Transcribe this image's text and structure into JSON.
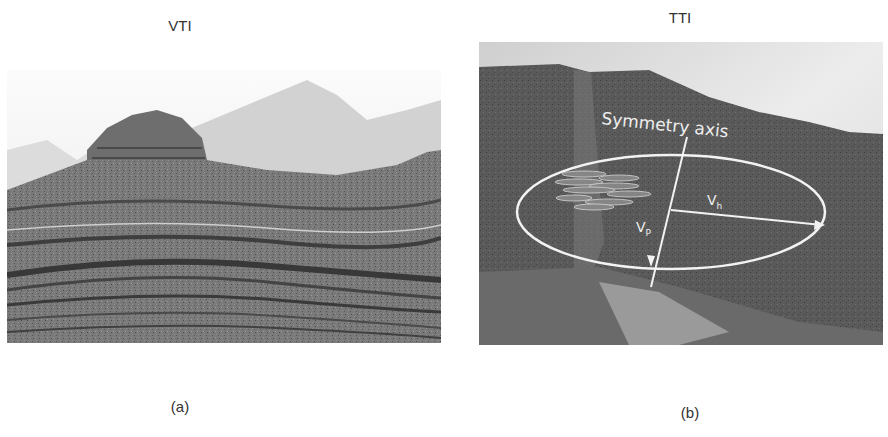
{
  "figure": {
    "panel_a": {
      "title": "VTI",
      "caption": "(a)",
      "image_description": "Horizontally layered sedimentary rock formation (canyon cliffs) illustrating vertical transverse isotropy"
    },
    "panel_b": {
      "title": "TTI",
      "caption": "(b)",
      "image_description": "Tilted rock layers on a cliff face with annotated anisotropy ellipse",
      "annotations": {
        "axis_label": "Symmetry axis",
        "vh_label": "V",
        "vh_sub": "h",
        "vp_label": "V",
        "vp_sub": "P"
      }
    }
  }
}
